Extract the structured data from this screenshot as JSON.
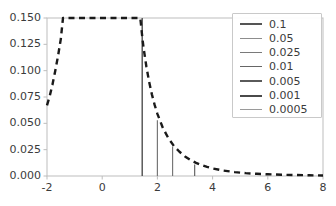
{
  "chart_data": {
    "type": "line",
    "title": "",
    "xlabel": "",
    "ylabel": "",
    "xlim": [
      -2,
      8
    ],
    "ylim": [
      0.0,
      0.15
    ],
    "grid": false,
    "xticks": [
      -2,
      0,
      2,
      4,
      6,
      8
    ],
    "xtick_labels": [
      "-2",
      "0",
      "2",
      "4",
      "6",
      "8"
    ],
    "yticks": [
      0.0,
      0.025,
      0.05,
      0.075,
      0.1,
      0.125,
      0.15
    ],
    "ytick_labels": [
      "0.000",
      "0.025",
      "0.050",
      "0.075",
      "0.100",
      "0.125",
      "0.150"
    ],
    "legend": {
      "position": "upper right",
      "entries": [
        {
          "label": "0.1",
          "color": "#555555",
          "linewidth": 2.0
        },
        {
          "label": "0.05",
          "color": "#8d8d8d",
          "linewidth": 1.4
        },
        {
          "label": "0.025",
          "color": "#7a7a7a",
          "linewidth": 1.6
        },
        {
          "label": "0.01",
          "color": "#666666",
          "linewidth": 1.8
        },
        {
          "label": "0.005",
          "color": "#5a5a5a",
          "linewidth": 2.0
        },
        {
          "label": "0.001",
          "color": "#4a4a4a",
          "linewidth": 2.2
        },
        {
          "label": "0.0005",
          "color": "#9a9a9a",
          "linewidth": 1.2
        }
      ]
    },
    "series": [
      {
        "name": "density-curve",
        "style": "dashed",
        "color": "#1a1a1a",
        "linewidth": 2.4,
        "points": [
          [
            -2.0,
            0.067
          ],
          [
            -1.9,
            0.076
          ],
          [
            -1.8,
            0.087
          ],
          [
            -1.7,
            0.1
          ],
          [
            -1.6,
            0.114
          ],
          [
            -1.5,
            0.13
          ],
          [
            -1.42,
            0.15
          ],
          [
            1.38,
            0.15
          ],
          [
            1.42,
            0.14
          ],
          [
            1.46,
            0.13
          ],
          [
            1.5,
            0.1215
          ],
          [
            1.6,
            0.104
          ],
          [
            1.7,
            0.0895
          ],
          [
            1.8,
            0.0775
          ],
          [
            1.9,
            0.0675
          ],
          [
            2.0,
            0.059
          ],
          [
            2.2,
            0.0455
          ],
          [
            2.4,
            0.0358
          ],
          [
            2.6,
            0.0285
          ],
          [
            2.8,
            0.023
          ],
          [
            3.0,
            0.0186
          ],
          [
            3.2,
            0.0152
          ],
          [
            3.4,
            0.0125
          ],
          [
            3.6,
            0.0103
          ],
          [
            3.8,
            0.0086
          ],
          [
            4.0,
            0.0072
          ],
          [
            4.4,
            0.0051
          ],
          [
            4.8,
            0.0037
          ],
          [
            5.2,
            0.0027
          ],
          [
            5.6,
            0.0021
          ],
          [
            6.0,
            0.0016
          ],
          [
            6.5,
            0.0012
          ],
          [
            7.0,
            0.0009
          ],
          [
            7.5,
            0.0007
          ],
          [
            8.0,
            0.0005
          ]
        ]
      }
    ],
    "stems": [
      {
        "x": 1.45,
        "y": 0.15,
        "color": "#5a5a5a",
        "linewidth": 1.5
      },
      {
        "x": 2.0,
        "y": 0.053,
        "color": "#777777",
        "linewidth": 1.2
      },
      {
        "x": 2.55,
        "y": 0.028,
        "color": "#777777",
        "linewidth": 1.2
      },
      {
        "x": 3.35,
        "y": 0.011,
        "color": "#666666",
        "linewidth": 1.2
      }
    ]
  }
}
